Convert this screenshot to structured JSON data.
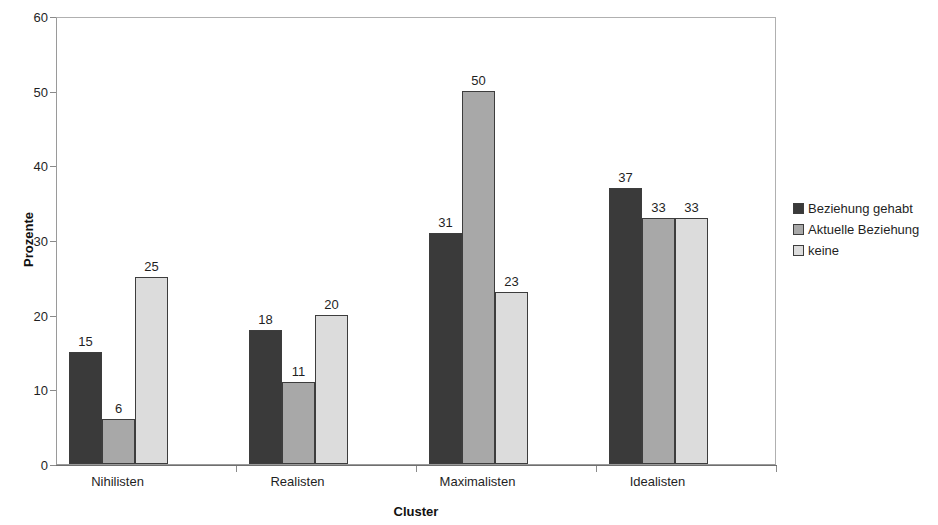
{
  "chart_data": {
    "type": "bar",
    "title": "",
    "subtitle": "",
    "xlabel": "Cluster",
    "ylabel": "Prozente",
    "categories": [
      "Nihilisten",
      "Realisten",
      "Maximalisten",
      "Idealisten"
    ],
    "series": [
      {
        "name": "Beziehung gehabt",
        "values": [
          15,
          18,
          31,
          37
        ],
        "color": "#3a3a3a"
      },
      {
        "name": "Aktuelle Beziehung",
        "values": [
          6,
          11,
          50,
          33
        ],
        "color": "#a8a8a8"
      },
      {
        "name": "keine",
        "values": [
          25,
          20,
          23,
          33
        ],
        "color": "#dcdcdc"
      }
    ],
    "ylim": [
      0,
      60
    ],
    "y_ticks": [
      0,
      10,
      20,
      30,
      40,
      50,
      60
    ],
    "grid": false,
    "show_data_labels": true,
    "legend_position": "right",
    "legend_clipped": true,
    "bar_border_color": "#3d3d3d",
    "plot_border_color": "#9a9a9a"
  },
  "legend": {
    "items": [
      {
        "label": "Beziehung gehabt",
        "swatch": "series-0-swatch"
      },
      {
        "label": "Aktuelle Beziehung",
        "swatch": "series-1-swatch"
      },
      {
        "label": "keine",
        "swatch": "series-2-swatch"
      }
    ]
  }
}
